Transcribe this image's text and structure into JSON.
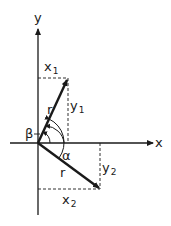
{
  "diagram": {
    "type": "vector-rotation",
    "axes": {
      "x_label": "x",
      "y_label": "y"
    },
    "vectors": [
      {
        "name": "r",
        "label": "r",
        "x_label": "x",
        "x_sub": "1",
        "y_label": "y",
        "y_sub": "1"
      },
      {
        "name": "r",
        "label": "r",
        "x_label": "x",
        "x_sub": "2",
        "y_label": "y",
        "y_sub": "2"
      }
    ],
    "angles": {
      "beta": "β",
      "alpha": "α"
    },
    "colors": {
      "ink": "#1a1a1a",
      "background": "#ffffff"
    }
  }
}
